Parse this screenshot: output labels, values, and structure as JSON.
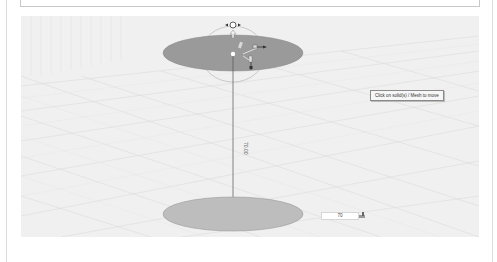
{
  "viewport": {
    "tooltip": "Click on solid(s) / Mesh to move",
    "dimension_label": "70.00",
    "value_input": "70"
  },
  "colors": {
    "background": "#f0f0f0",
    "top_disc": "#9a9a9a",
    "bottom_disc": "#bdbdbd",
    "grid": "#dedede",
    "frame": "#c8c8c8"
  },
  "scene": {
    "objects": [
      "top-disc",
      "bottom-disc",
      "dimension-line",
      "rotation-gizmo",
      "move-gizmo"
    ]
  }
}
